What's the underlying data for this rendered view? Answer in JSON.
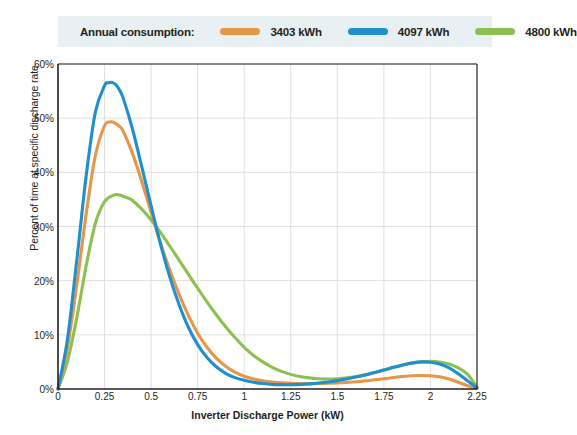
{
  "legend": {
    "title": "Annual consumption:",
    "items": [
      {
        "label": "3403 kWh",
        "color": "#e79548",
        "icon": "legend-line-swatch"
      },
      {
        "label": "4097 kWh",
        "color": "#1f8fcd",
        "icon": "legend-line-swatch"
      },
      {
        "label": "4800 kWh",
        "color": "#8cc152",
        "icon": "legend-line-swatch"
      }
    ],
    "background": "#e9f0f4"
  },
  "chart_data": {
    "type": "line",
    "title": "",
    "xlabel": "Inverter Discharge Power (kW)",
    "ylabel": "Percent of time at specific discharge rate",
    "xlim": [
      0,
      2.25
    ],
    "ylim": [
      0,
      60
    ],
    "xticks": [
      0,
      0.25,
      0.5,
      0.75,
      1,
      1.25,
      1.5,
      1.75,
      2,
      2.25
    ],
    "xtick_labels": [
      "0",
      "0.25",
      "0.5",
      "0.75",
      "1",
      "1.25",
      "1.5",
      "1.75",
      "2",
      "2.25"
    ],
    "yticks": [
      0,
      10,
      20,
      30,
      40,
      50,
      60
    ],
    "ytick_labels": [
      "0%",
      "10%",
      "20%",
      "30%",
      "40%",
      "50%",
      "60%"
    ],
    "grid": true,
    "legend_position": "top",
    "series": [
      {
        "name": "3403 kWh",
        "color": "#e79548",
        "x": [
          0,
          0.05,
          0.1,
          0.15,
          0.2,
          0.25,
          0.28,
          0.3,
          0.33,
          0.35,
          0.4,
          0.45,
          0.5,
          0.55,
          0.6,
          0.65,
          0.7,
          0.75,
          0.8,
          0.85,
          0.9,
          0.95,
          1.0,
          1.05,
          1.1,
          1.15,
          1.2,
          1.25,
          1.3,
          1.35,
          1.4,
          1.45,
          1.5,
          1.55,
          1.6,
          1.65,
          1.7,
          1.75,
          1.8,
          1.85,
          1.9,
          1.95,
          2.0,
          2.05,
          2.1,
          2.15,
          2.2,
          2.25
        ],
        "y": [
          0,
          7.5,
          19.0,
          32.0,
          43.0,
          48.6,
          49.3,
          49.2,
          48.5,
          47.6,
          43.5,
          38.3,
          32.6,
          27.0,
          22.0,
          17.5,
          13.6,
          10.3,
          7.7,
          5.7,
          4.2,
          3.1,
          2.35,
          1.85,
          1.5,
          1.3,
          1.15,
          1.05,
          1.0,
          1.0,
          1.0,
          1.05,
          1.1,
          1.2,
          1.35,
          1.5,
          1.7,
          1.9,
          2.1,
          2.3,
          2.45,
          2.5,
          2.45,
          2.25,
          1.85,
          1.25,
          0.6,
          0.1
        ]
      },
      {
        "name": "4097 kWh",
        "color": "#1f8fcd",
        "x": [
          0,
          0.05,
          0.1,
          0.15,
          0.2,
          0.25,
          0.27,
          0.29,
          0.31,
          0.33,
          0.35,
          0.4,
          0.45,
          0.5,
          0.55,
          0.6,
          0.65,
          0.7,
          0.75,
          0.8,
          0.85,
          0.9,
          0.95,
          1.0,
          1.05,
          1.1,
          1.15,
          1.2,
          1.25,
          1.3,
          1.35,
          1.4,
          1.45,
          1.5,
          1.55,
          1.6,
          1.65,
          1.7,
          1.75,
          1.8,
          1.85,
          1.9,
          1.95,
          2.0,
          2.05,
          2.1,
          2.15,
          2.2,
          2.25
        ],
        "y": [
          0,
          9.0,
          23.5,
          39.0,
          51.0,
          56.0,
          56.5,
          56.6,
          56.2,
          55.2,
          53.7,
          48.0,
          41.0,
          33.8,
          26.8,
          20.7,
          15.6,
          11.4,
          8.2,
          5.8,
          4.1,
          2.9,
          2.1,
          1.6,
          1.25,
          1.0,
          0.85,
          0.8,
          0.8,
          0.85,
          0.95,
          1.1,
          1.3,
          1.55,
          1.85,
          2.2,
          2.6,
          3.05,
          3.5,
          4.0,
          4.45,
          4.8,
          5.0,
          4.95,
          4.6,
          3.9,
          2.8,
          1.5,
          0.2
        ]
      },
      {
        "name": "4800 kWh",
        "color": "#8cc152",
        "x": [
          0,
          0.05,
          0.1,
          0.15,
          0.2,
          0.25,
          0.3,
          0.33,
          0.35,
          0.38,
          0.4,
          0.45,
          0.5,
          0.55,
          0.6,
          0.65,
          0.7,
          0.75,
          0.8,
          0.85,
          0.9,
          0.95,
          1.0,
          1.05,
          1.1,
          1.15,
          1.2,
          1.25,
          1.3,
          1.35,
          1.4,
          1.45,
          1.5,
          1.55,
          1.6,
          1.65,
          1.7,
          1.75,
          1.8,
          1.85,
          1.9,
          1.95,
          2.0,
          2.05,
          2.1,
          2.15,
          2.2,
          2.25
        ],
        "y": [
          0,
          5.0,
          13.0,
          22.5,
          30.5,
          34.6,
          35.8,
          35.8,
          35.6,
          35.2,
          34.8,
          33.2,
          31.2,
          28.9,
          26.4,
          23.8,
          21.2,
          18.6,
          16.1,
          13.7,
          11.5,
          9.5,
          7.7,
          6.2,
          5.0,
          4.0,
          3.25,
          2.7,
          2.3,
          2.05,
          1.9,
          1.85,
          1.9,
          2.05,
          2.3,
          2.65,
          3.05,
          3.5,
          3.95,
          4.4,
          4.75,
          5.0,
          5.1,
          5.0,
          4.6,
          3.9,
          2.7,
          0.3
        ]
      }
    ]
  }
}
